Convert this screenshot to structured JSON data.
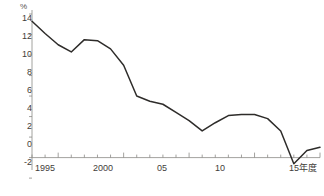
{
  "chart_data": {
    "type": "line",
    "title": "",
    "subtitle": "",
    "xlabel": "15年度",
    "ylabel": "%",
    "unit": "%",
    "x_axis_end_label": "15年度",
    "ylim": [
      -2,
      14
    ],
    "xlim": [
      1993,
      2015
    ],
    "yticks": [
      14,
      12,
      10,
      8,
      6,
      4,
      2,
      0,
      -2
    ],
    "ytick_labels": [
      "14",
      "12",
      "10",
      "8",
      "6",
      "4",
      "2",
      "0",
      "-2"
    ],
    "xticks": [
      1995,
      2000,
      2005,
      2010,
      2015
    ],
    "xtick_labels": [
      "1995",
      "2000",
      "05",
      "10",
      "15年度"
    ],
    "minor_xticks": [
      1993,
      1994,
      1996,
      1997,
      1998,
      1999,
      2001,
      2002,
      2003,
      2004,
      2006,
      2007,
      2008,
      2009,
      2011,
      2012,
      2013,
      2014
    ],
    "grid": false,
    "legend": "none",
    "zero_line": true,
    "series": [
      {
        "name": "",
        "color": "#2e2c2a",
        "x": [
          1993,
          1994,
          1995,
          1996,
          1997,
          1998,
          1999,
          2000,
          2001,
          2002,
          2003,
          2004,
          2005,
          2006,
          2007,
          2008,
          2009,
          2010,
          2011,
          2012,
          2013,
          2014,
          2015
        ],
        "values": [
          13.3,
          12.1,
          11.0,
          10.3,
          11.5,
          11.4,
          10.6,
          9.0,
          6.0,
          5.5,
          5.2,
          4.4,
          3.6,
          2.6,
          3.4,
          4.1,
          4.2,
          4.2,
          3.8,
          2.6,
          -0.6,
          0.7,
          1.0
        ]
      }
    ]
  }
}
